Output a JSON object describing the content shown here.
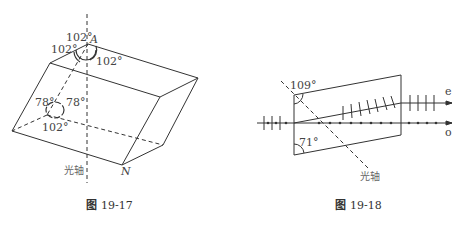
{
  "figures": [
    {
      "caption_prefix": "图",
      "caption_number": "19-17",
      "labels": {
        "vertex_a": "A",
        "vertex_n": "N",
        "angle_top_1": "102°",
        "angle_top_2": "102°",
        "angle_top_3": "102°",
        "angle_low_left": "78°",
        "angle_low_right": "78°",
        "angle_low_bottom": "102°",
        "optic_axis": "光轴"
      }
    },
    {
      "caption_prefix": "图",
      "caption_number": "19-18",
      "labels": {
        "angle_top": "109°",
        "angle_bottom": "71°",
        "ray_e": "e",
        "ray_o": "o",
        "optic_axis": "光轴"
      }
    }
  ]
}
